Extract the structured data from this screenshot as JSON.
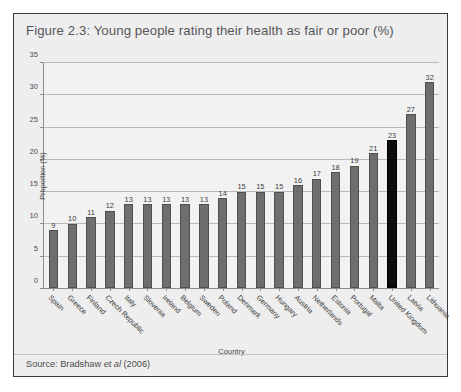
{
  "figure": {
    "title": "Figure 2.3: Young people rating their health as fair or poor (%)",
    "source_prefix": "Source: Bradshaw ",
    "source_italic": "et al",
    "source_suffix": " (2006)"
  },
  "colors": {
    "panel_background": "#eeeeee",
    "panel_border": "#3a3a3a",
    "plot_background": "#f2f2f2",
    "bar_fill": "#6e6e6e",
    "bar_highlight_fill": "#0c0c0c",
    "gridline": "#b9b9b9",
    "axis_line": "#8c8c8c",
    "title_text": "#56565a",
    "axis_text": "#4a4a4a"
  },
  "chart_data": {
    "type": "bar",
    "title": "Figure 2.3: Young people rating their health as fair or poor (%)",
    "xlabel": "Country",
    "ylabel": "Proportion (%)",
    "ylim": [
      0,
      35
    ],
    "yticks": [
      0,
      5,
      10,
      15,
      20,
      25,
      30,
      35
    ],
    "ytick_labels": [
      "0",
      "5",
      "10",
      "15",
      "20",
      "25",
      "30",
      "35"
    ],
    "grid": true,
    "legend": "none",
    "highlight_category": "United Kingdom",
    "categories": [
      "Spain",
      "Greece",
      "Finland",
      "Czech Republic",
      "Italy",
      "Slovenia",
      "Ireland",
      "Belgium",
      "Sweden",
      "Poland",
      "Denmark",
      "Germany",
      "Hungary",
      "Austria",
      "Netherlands",
      "Estonia",
      "Portugal",
      "Malta",
      "United Kingdom",
      "Latvia",
      "Lithuania"
    ],
    "values": [
      9,
      10,
      11,
      12,
      13,
      13,
      13,
      13,
      13,
      14,
      15,
      15,
      15,
      16,
      17,
      18,
      19,
      21,
      23,
      27,
      32
    ],
    "data_labels": [
      "9",
      "10",
      "11",
      "12",
      "13",
      "13",
      "13",
      "13",
      "13",
      "14",
      "15",
      "15",
      "15",
      "16",
      "17",
      "18",
      "19",
      "21",
      "23",
      "27",
      "32"
    ]
  }
}
